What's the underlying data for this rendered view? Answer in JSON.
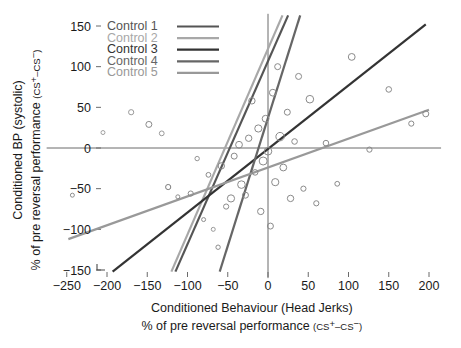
{
  "chart_data": {
    "type": "scatter",
    "title": "",
    "xlabel": "Conditioned Behaviour (Head Jerks)",
    "xlabel_sub_prefix": "% of pre reversal performance ",
    "xlabel_sub_paren": "(CS",
    "ylabel": "Conditioned BP (systolic)",
    "ylabel_sub_prefix": "% of pre reversal performance ",
    "ylabel_sub_paren": "(CS",
    "sup_plus": "+",
    "sup_minus": "−",
    "paren_close": ")",
    "cs_mid": "–CS",
    "xlim": [
      -275,
      215
    ],
    "ylim": [
      -160,
      165
    ],
    "xticks": [
      -250,
      -200,
      -150,
      -100,
      -50,
      0,
      50,
      100,
      150,
      200
    ],
    "xtick_labels": [
      "−250",
      "−200",
      "−150",
      "−100",
      "−50",
      "0",
      "50",
      "100",
      "150",
      "200"
    ],
    "yticks": [
      -150,
      -100,
      -50,
      0,
      50,
      100,
      150
    ],
    "ytick_labels": [
      "−150",
      "−100",
      "−50",
      "0",
      "50",
      "100",
      "150"
    ],
    "grid": false,
    "zero_lines": true,
    "legend_position": "top-left",
    "series": [
      {
        "name": "Control 1",
        "color": "#555555",
        "width": 2.2,
        "line": {
          "x1": -115,
          "y1": -152,
          "x2": 25,
          "y2": 163
        }
      },
      {
        "name": "Control 2",
        "color": "#a8a8a8",
        "width": 2.2,
        "line": {
          "x1": -120,
          "y1": -152,
          "x2": 18,
          "y2": 163
        }
      },
      {
        "name": "Control 3",
        "color": "#333333",
        "width": 2.2,
        "line": {
          "x1": -193,
          "y1": -152,
          "x2": 196,
          "y2": 152
        }
      },
      {
        "name": "Control 4",
        "color": "#666666",
        "width": 2.2,
        "line": {
          "x1": -60,
          "y1": -152,
          "x2": 40,
          "y2": 163
        }
      },
      {
        "name": "Control 5",
        "color": "#999999",
        "width": 2.2,
        "line": {
          "x1": -248,
          "y1": -112,
          "x2": 200,
          "y2": 47
        }
      }
    ],
    "points": [
      {
        "x": -243,
        "y": -58,
        "r": 2.0,
        "c": "#8d8d8d"
      },
      {
        "x": -205,
        "y": 19,
        "r": 2.0,
        "c": "#a0a0a0"
      },
      {
        "x": -170,
        "y": 44,
        "r": 2.6,
        "c": "#9a9a9a"
      },
      {
        "x": -148,
        "y": 29,
        "r": 3.0,
        "c": "#8a8a8a"
      },
      {
        "x": -132,
        "y": 18,
        "r": 2.4,
        "c": "#9a9a9a"
      },
      {
        "x": -124,
        "y": -48,
        "r": 2.6,
        "c": "#7e7e7e"
      },
      {
        "x": -112,
        "y": -60,
        "r": 2.0,
        "c": "#8d8d8d"
      },
      {
        "x": -96,
        "y": -56,
        "r": 2.6,
        "c": "#8a8a8a"
      },
      {
        "x": -88,
        "y": -13,
        "r": 2.2,
        "c": "#949494"
      },
      {
        "x": -80,
        "y": -88,
        "r": 2.0,
        "c": "#8d8d8d"
      },
      {
        "x": -74,
        "y": -33,
        "r": 2.4,
        "c": "#8a8a8a"
      },
      {
        "x": -68,
        "y": -100,
        "r": 2.0,
        "c": "#9a9a9a"
      },
      {
        "x": -62,
        "y": -122,
        "r": 2.2,
        "c": "#8d8d8d"
      },
      {
        "x": -58,
        "y": -22,
        "r": 3.2,
        "c": "#8a8a8a"
      },
      {
        "x": -52,
        "y": -72,
        "r": 2.6,
        "c": "#8a8a8a"
      },
      {
        "x": -46,
        "y": -62,
        "r": 3.6,
        "c": "#8a8a8a"
      },
      {
        "x": -42,
        "y": -10,
        "r": 3.0,
        "c": "#8a8a8a"
      },
      {
        "x": -36,
        "y": 4,
        "r": 3.4,
        "c": "#8a8a8a"
      },
      {
        "x": -33,
        "y": -45,
        "r": 3.8,
        "c": "#8a8a8a"
      },
      {
        "x": -28,
        "y": -58,
        "r": 3.0,
        "c": "#8a8a8a"
      },
      {
        "x": -24,
        "y": 12,
        "r": 3.2,
        "c": "#8a8a8a"
      },
      {
        "x": -20,
        "y": 58,
        "r": 3.2,
        "c": "#8a8a8a"
      },
      {
        "x": -16,
        "y": -30,
        "r": 2.8,
        "c": "#8a8a8a"
      },
      {
        "x": -12,
        "y": 24,
        "r": 3.6,
        "c": "#8a8a8a"
      },
      {
        "x": -9,
        "y": -78,
        "r": 3.2,
        "c": "#8a8a8a"
      },
      {
        "x": -6,
        "y": -16,
        "r": 4.0,
        "c": "#8a8a8a"
      },
      {
        "x": -3,
        "y": 36,
        "r": 3.4,
        "c": "#8a8a8a"
      },
      {
        "x": 0,
        "y": -4,
        "r": 3.8,
        "c": "#8a8a8a"
      },
      {
        "x": 3,
        "y": -96,
        "r": 3.0,
        "c": "#8a8a8a"
      },
      {
        "x": 6,
        "y": 68,
        "r": 3.4,
        "c": "#8a8a8a"
      },
      {
        "x": 9,
        "y": -42,
        "r": 3.6,
        "c": "#8a8a8a"
      },
      {
        "x": 12,
        "y": 100,
        "r": 3.0,
        "c": "#8a8a8a"
      },
      {
        "x": 15,
        "y": 14,
        "r": 4.2,
        "c": "#8a8a8a"
      },
      {
        "x": 19,
        "y": -24,
        "r": 3.4,
        "c": "#8a8a8a"
      },
      {
        "x": 24,
        "y": 44,
        "r": 3.0,
        "c": "#8a8a8a"
      },
      {
        "x": 28,
        "y": -62,
        "r": 3.2,
        "c": "#8a8a8a"
      },
      {
        "x": 33,
        "y": 8,
        "r": 2.8,
        "c": "#8a8a8a"
      },
      {
        "x": 38,
        "y": 88,
        "r": 3.0,
        "c": "#8a8a8a"
      },
      {
        "x": 44,
        "y": -50,
        "r": 2.6,
        "c": "#8a8a8a"
      },
      {
        "x": 52,
        "y": 60,
        "r": 3.8,
        "c": "#8a8a8a"
      },
      {
        "x": 60,
        "y": -68,
        "r": 2.6,
        "c": "#8a8a8a"
      },
      {
        "x": 72,
        "y": 6,
        "r": 2.8,
        "c": "#8a8a8a"
      },
      {
        "x": 86,
        "y": -44,
        "r": 2.4,
        "c": "#8a8a8a"
      },
      {
        "x": 104,
        "y": 112,
        "r": 3.4,
        "c": "#8a8a8a"
      },
      {
        "x": 126,
        "y": -2,
        "r": 2.6,
        "c": "#8a8a8a"
      },
      {
        "x": 150,
        "y": 72,
        "r": 2.8,
        "c": "#8a8a8a"
      },
      {
        "x": 178,
        "y": 30,
        "r": 2.6,
        "c": "#8a8a8a"
      },
      {
        "x": 196,
        "y": 42,
        "r": 3.0,
        "c": "#8a8a8a"
      }
    ]
  },
  "legend": {
    "items": [
      {
        "label": "Control 1"
      },
      {
        "label": "Control 2"
      },
      {
        "label": "Control 3"
      },
      {
        "label": "Control 4"
      },
      {
        "label": "Control 5"
      }
    ]
  }
}
